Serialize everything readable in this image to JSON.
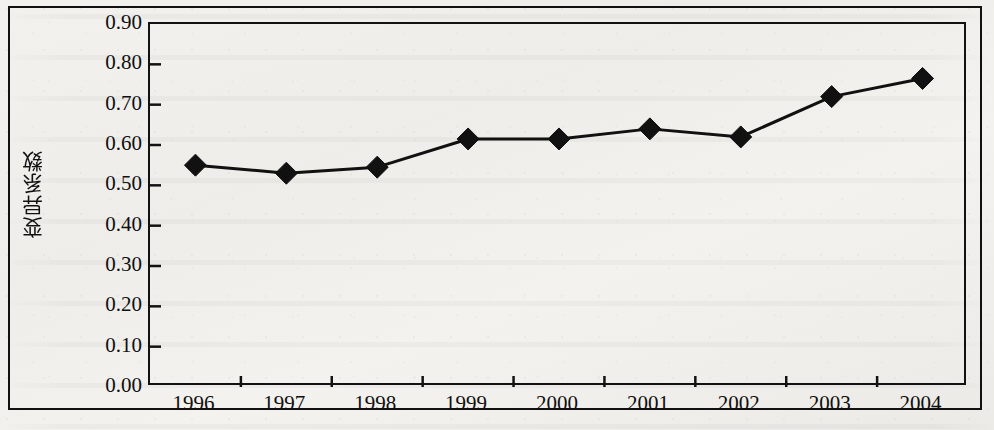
{
  "chart_data": {
    "type": "line",
    "title": "",
    "xlabel": "年份",
    "ylabel": "变异系数",
    "categories": [
      "1996",
      "1997",
      "1998",
      "1999",
      "2000",
      "2001",
      "2002",
      "2003",
      "2004"
    ],
    "values": [
      0.55,
      0.53,
      0.545,
      0.615,
      0.615,
      0.64,
      0.62,
      0.72,
      0.765
    ],
    "series": [
      {
        "name": "变异系数",
        "values": [
          0.55,
          0.53,
          0.545,
          0.615,
          0.615,
          0.64,
          0.62,
          0.72,
          0.765
        ]
      }
    ],
    "ylim": [
      0.0,
      0.9
    ],
    "ytick_labels": [
      "0.00",
      "0.10",
      "0.20",
      "0.30",
      "0.40",
      "0.50",
      "0.60",
      "0.70",
      "0.80",
      "0.90"
    ],
    "ytick_values": [
      0.0,
      0.1,
      0.2,
      0.3,
      0.4,
      0.5,
      0.6,
      0.7,
      0.8,
      0.9
    ],
    "grid": false,
    "legend": "none",
    "marker": "diamond",
    "line_color": "#111111",
    "marker_color": "#111111"
  },
  "figure": {
    "background_color": "#f0efec",
    "frame_color": "#111111"
  }
}
